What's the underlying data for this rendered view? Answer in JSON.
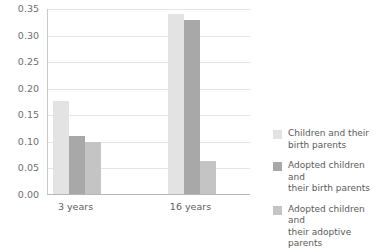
{
  "chart_data": {
    "type": "bar",
    "title": "",
    "subtitle": "",
    "xlabel": "",
    "ylabel": "",
    "categories": [
      "3 years",
      "16 years"
    ],
    "series": [
      {
        "name": "Children and their birth parents",
        "color": "#e3e3e3",
        "values": [
          0.175,
          0.338
        ]
      },
      {
        "name": "Adopted children and their birth parents",
        "color": "#a8a8a8",
        "values": [
          0.11,
          0.328
        ]
      },
      {
        "name": "Adopted children and their adoptive parents",
        "color": "#c4c4c4",
        "values": [
          0.098,
          0.063
        ]
      }
    ],
    "ylim": [
      0.0,
      0.35
    ],
    "ytick_values": [
      0.0,
      0.05,
      0.1,
      0.15,
      0.2,
      0.25,
      0.3,
      0.35
    ],
    "ytick_labels": [
      "0.00",
      "0.05",
      "0.10",
      "0.15",
      "0.20",
      "0.25",
      "0.30",
      "0.35"
    ],
    "grid": "horizontal",
    "legend_position": "right"
  },
  "legend": {
    "items": [
      {
        "label": "Children and their\nbirth parents",
        "color": "#e3e3e3"
      },
      {
        "label": "Adopted children and\ntheir birth parents",
        "color": "#a8a8a8"
      },
      {
        "label": "Adopted children and\ntheir adoptive parents",
        "color": "#c4c4c4"
      }
    ]
  }
}
